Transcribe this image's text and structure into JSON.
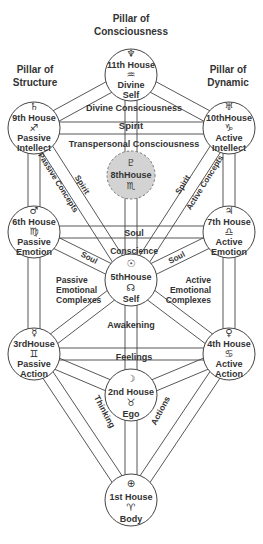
{
  "pillars": [
    {
      "id": "consciousness",
      "line1": "Pillar of",
      "line2": "Consciousness"
    },
    {
      "id": "structure",
      "line1": "Pillar of",
      "line2": "Structure"
    },
    {
      "id": "dynamic",
      "line1": "Pillar of",
      "line2": "Dynamic"
    }
  ],
  "nodes": [
    {
      "id": "h11",
      "house": "11th House",
      "planet_symbol": "♆",
      "planet": "neptune",
      "sign_symbol": "♒",
      "sign": "aquarius",
      "lines": [
        "Divine",
        "Self"
      ],
      "style": "solid"
    },
    {
      "id": "h9",
      "house": "9th House",
      "planet_symbol": "♄",
      "planet": "saturn",
      "sign_symbol": "♐",
      "sign": "sagittarius",
      "lines": [
        "Passive",
        "Intellect"
      ],
      "style": "solid"
    },
    {
      "id": "h10",
      "house": "10thHouse",
      "planet_symbol": "♅",
      "planet": "uranus",
      "sign_symbol": "♑",
      "sign": "capricorn",
      "lines": [
        "Active",
        "Intellect"
      ],
      "style": "solid"
    },
    {
      "id": "h8",
      "house": "8thHouse",
      "planet_symbol": "♇",
      "planet": "pluto",
      "sign_symbol": "♏",
      "sign": "scorpio",
      "lines": [],
      "style": "dashed-gray"
    },
    {
      "id": "h6",
      "house": "6th House",
      "planet_symbol": "♂",
      "planet": "mars",
      "sign_symbol": "♍",
      "sign": "virgo",
      "lines": [
        "Passive",
        "Emotion"
      ],
      "style": "solid"
    },
    {
      "id": "h7",
      "house": "7th House",
      "planet_symbol": "♃",
      "planet": "jupiter",
      "sign_symbol": "♎",
      "sign": "libra",
      "lines": [
        "Active",
        "Emotion"
      ],
      "style": "solid"
    },
    {
      "id": "h5",
      "house": "5thHouse",
      "planet_symbol": "☉",
      "planet": "sun",
      "sign_symbol": "☊",
      "sign": "north-node",
      "lines": [
        "Self"
      ],
      "style": "solid"
    },
    {
      "id": "h3",
      "house": "3rdHouse",
      "planet_symbol": "☿",
      "planet": "mercury",
      "sign_symbol": "♊",
      "sign": "gemini",
      "lines": [
        "Passive",
        "Action"
      ],
      "style": "solid"
    },
    {
      "id": "h4",
      "house": "4th House",
      "planet_symbol": "♀",
      "planet": "venus",
      "sign_symbol": "♋",
      "sign": "cancer",
      "lines": [
        "Active",
        "Action"
      ],
      "style": "solid"
    },
    {
      "id": "h2",
      "house": "2nd House",
      "planet_symbol": "☽",
      "planet": "moon",
      "sign_symbol": "♉",
      "sign": "taurus",
      "lines": [
        "Ego"
      ],
      "style": "solid"
    },
    {
      "id": "h1",
      "house": "1st House",
      "planet_symbol": "⊕",
      "planet": "earth",
      "sign_symbol": "♈",
      "sign": "aries",
      "lines": [
        "Body"
      ],
      "style": "solid"
    }
  ],
  "paths": [
    {
      "from": "h11",
      "to": "h9"
    },
    {
      "from": "h11",
      "to": "h10"
    },
    {
      "from": "h11",
      "to": "h5"
    },
    {
      "from": "h9",
      "to": "h10"
    },
    {
      "from": "h9",
      "to": "h6"
    },
    {
      "from": "h9",
      "to": "h5"
    },
    {
      "from": "h10",
      "to": "h7"
    },
    {
      "from": "h10",
      "to": "h5"
    },
    {
      "from": "h6",
      "to": "h7"
    },
    {
      "from": "h6",
      "to": "h5"
    },
    {
      "from": "h6",
      "to": "h3"
    },
    {
      "from": "h7",
      "to": "h5"
    },
    {
      "from": "h7",
      "to": "h4"
    },
    {
      "from": "h5",
      "to": "h3"
    },
    {
      "from": "h5",
      "to": "h4"
    },
    {
      "from": "h5",
      "to": "h2"
    },
    {
      "from": "h3",
      "to": "h4"
    },
    {
      "from": "h3",
      "to": "h2"
    },
    {
      "from": "h3",
      "to": "h1"
    },
    {
      "from": "h4",
      "to": "h2"
    },
    {
      "from": "h4",
      "to": "h1"
    },
    {
      "from": "h2",
      "to": "h1"
    }
  ],
  "labels": {
    "divine_consciousness": "Divine Consciousness",
    "spirit_horizontal": "Spirit",
    "transpersonal_consciousness": "Transpersonal Consciousness",
    "spirit_left": "Spirit",
    "passive_concepts": "Passive Concepts",
    "spirit_right": "Spirit",
    "active_concepts": "Active Concepts",
    "soul_horizontal": "Soul",
    "conscience": "Conscience",
    "soul_left": "Soul",
    "soul_right": "Soul",
    "passive_emotional_complexes": [
      "Passive",
      "Emotional",
      "Complexes"
    ],
    "active_emotional_complexes": [
      "Active",
      "Emotional",
      "Complexes"
    ],
    "awakening": "Awakening",
    "feelings": "Feelings",
    "thinking": "Thinking",
    "actions": "Actions"
  },
  "colors": {
    "line": "#444444",
    "text": "#333333",
    "eighth_fill": "#d3d3d3",
    "background": "#ffffff"
  }
}
